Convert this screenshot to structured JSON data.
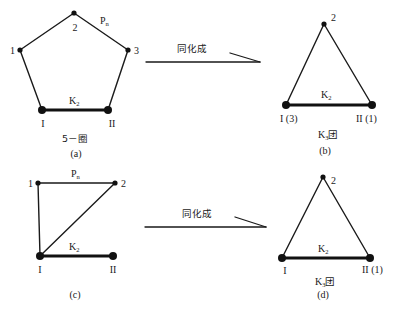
{
  "figure": {
    "panel_a": {
      "caption": "(a)",
      "name": "5－圈",
      "nodes": {
        "n1": "1",
        "n2": "2",
        "n3": "3",
        "nI": "I",
        "nII": "II"
      },
      "path_label": {
        "main": "P",
        "sub": "n"
      },
      "edge_label": {
        "main": "K",
        "sub": "2"
      }
    },
    "arrow_top": {
      "label": "同化成"
    },
    "panel_b": {
      "caption": "(b)",
      "name": {
        "main": "K",
        "sub": "3",
        "suffix": "团"
      },
      "nodes": {
        "n2": "2",
        "nI": "I (3)",
        "nII": "II (1)"
      },
      "edge_label": {
        "main": "K",
        "sub": "2"
      }
    },
    "panel_c": {
      "caption": "(c)",
      "nodes": {
        "n1": "1",
        "n2": "2",
        "nI": "I",
        "nII": "II"
      },
      "path_label": {
        "main": "P",
        "sub": "n"
      },
      "edge_label": {
        "main": "K",
        "sub": "2"
      }
    },
    "arrow_bottom": {
      "label": "同化成"
    },
    "panel_d": {
      "caption": "(d)",
      "name": {
        "main": "K",
        "sub": "3",
        "suffix": "团"
      },
      "nodes": {
        "n2": "2",
        "nI": "I",
        "nII": "II (1)"
      },
      "edge_label": {
        "main": "K",
        "sub": "2"
      }
    }
  }
}
